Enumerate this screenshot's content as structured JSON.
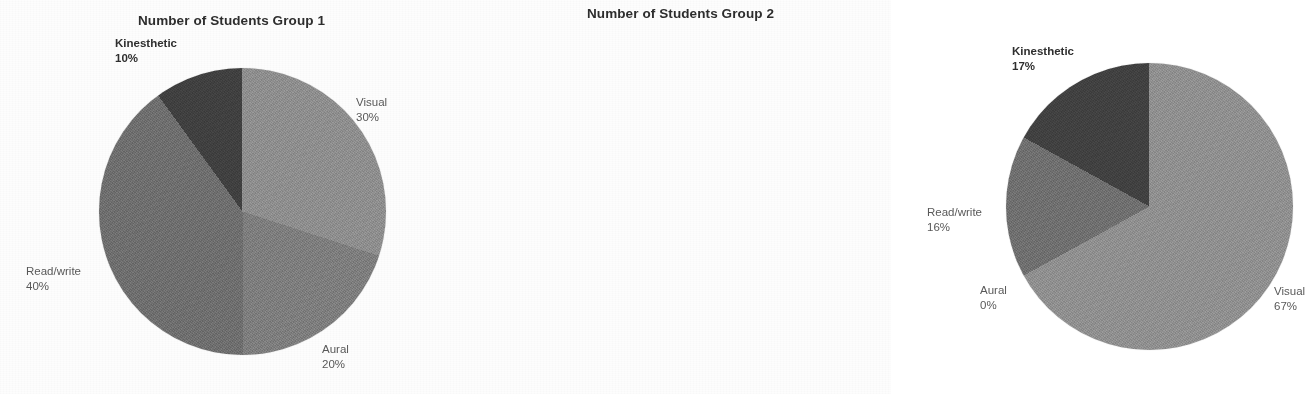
{
  "document": {
    "background_color": "#fdfdfd",
    "text_color": "#3a3a3a"
  },
  "charts": [
    {
      "id": "group-1",
      "title": "Number of Students Group 1",
      "labels": {
        "visual": {
          "name": "Visual",
          "pct": "30%"
        },
        "aural": {
          "name": "Aural",
          "pct": "20%"
        },
        "readwrite": {
          "name": "Read/write",
          "pct": "40%"
        },
        "kinesthetic": {
          "name": "Kinesthetic",
          "pct": "10%"
        }
      }
    },
    {
      "id": "group-2",
      "title": "Number of Students Group 2",
      "labels": {
        "visual": {
          "name": "Visual",
          "pct": "67%"
        },
        "aural": {
          "name": "Aural",
          "pct": "0%"
        },
        "readwrite": {
          "name": "Read/write",
          "pct": "16%"
        },
        "kinesthetic": {
          "name": "Kinesthetic",
          "pct": "17%"
        }
      }
    }
  ],
  "colors": {
    "visual": "#8d8d8d",
    "aural": "#7c7c7c",
    "readwrite": "#6d6d6d",
    "kinesthetic": "#3f3f3f",
    "label_text": "#595959",
    "title_text": "#2e2e2e"
  },
  "chart_data": [
    {
      "type": "pie",
      "title": "Number of Students Group 1",
      "categories": [
        "Visual",
        "Aural",
        "Read/write",
        "Kinesthetic"
      ],
      "values": [
        30,
        20,
        40,
        10
      ],
      "value_unit": "percent",
      "data_labels": [
        "30%",
        "20%",
        "40%",
        "10%"
      ],
      "colors": [
        "#8d8d8d",
        "#7c7c7c",
        "#6d6d6d",
        "#3f3f3f"
      ],
      "start_angle_deg": 0,
      "direction": "clockwise",
      "legend": "none",
      "labels_position": "outside",
      "xlabel": "",
      "ylabel": ""
    },
    {
      "type": "pie",
      "title": "Number of Students Group 2",
      "categories": [
        "Visual",
        "Aural",
        "Read/write",
        "Kinesthetic"
      ],
      "values": [
        67,
        0,
        16,
        17
      ],
      "value_unit": "percent",
      "data_labels": [
        "67%",
        "0%",
        "16%",
        "17%"
      ],
      "colors": [
        "#8d8d8d",
        "#7c7c7c",
        "#6d6d6d",
        "#3f3f3f"
      ],
      "start_angle_deg": 0,
      "direction": "clockwise",
      "legend": "none",
      "labels_position": "outside",
      "xlabel": "",
      "ylabel": ""
    }
  ]
}
